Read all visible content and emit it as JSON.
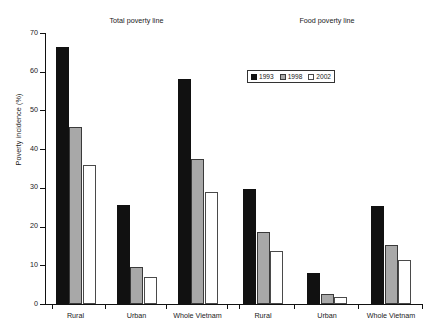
{
  "chart_data": {
    "type": "bar",
    "title": "",
    "xlabel": "",
    "ylabel": "Poverty incidence (%)",
    "ylim": [
      0,
      70
    ],
    "yticks": [
      0,
      10,
      20,
      30,
      40,
      50,
      60,
      70
    ],
    "grid": false,
    "legend_position": "top-center-right",
    "legend": [
      "1993",
      "1998",
      "2002"
    ],
    "panels": [
      {
        "title": "Total poverty line",
        "categories": [
          "Rural",
          "Urban",
          "Whole Vietnam"
        ],
        "series": [
          {
            "name": "1993",
            "values": [
              66.4,
              25.5,
              58.2
            ]
          },
          {
            "name": "1998",
            "values": [
              45.6,
              9.5,
              37.4
            ]
          },
          {
            "name": "2002",
            "values": [
              36.0,
              7.0,
              28.9
            ]
          }
        ]
      },
      {
        "title": "Food poverty line",
        "categories": [
          "Rural",
          "Urban",
          "Whole Vietnam"
        ],
        "series": [
          {
            "name": "1993",
            "values": [
              29.6,
              7.9,
              25.2
            ]
          },
          {
            "name": "1998",
            "values": [
              18.7,
              2.5,
              15.2
            ]
          },
          {
            "name": "2002",
            "values": [
              13.6,
              1.9,
              11.3
            ]
          }
        ]
      }
    ],
    "colors": {
      "1993": "#111111",
      "1998": "#a8a8a8",
      "2002": "#ffffff"
    }
  }
}
